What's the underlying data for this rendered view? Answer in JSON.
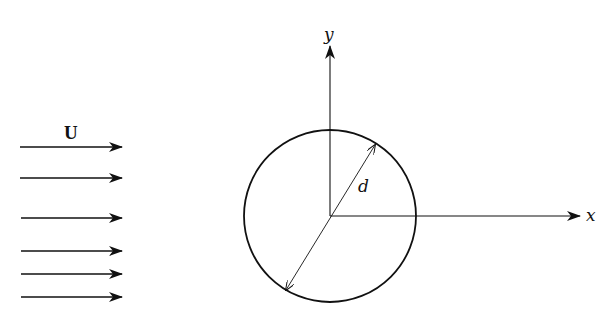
{
  "diagram": {
    "flow": {
      "label": "U",
      "arrow_y": [
        147,
        178,
        218,
        251,
        274,
        297
      ],
      "x_start": 20,
      "x_end": 122
    },
    "axes": {
      "origin": [
        330,
        216
      ],
      "x_label": "x",
      "y_label": "y",
      "x_end": 580,
      "y_end": 44
    },
    "cylinder": {
      "center": [
        330,
        216
      ],
      "radius": 86,
      "diameter_label": "d"
    },
    "colors": {
      "line": "#111111",
      "background": "#ffffff"
    }
  }
}
